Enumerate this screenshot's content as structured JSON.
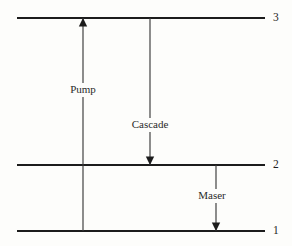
{
  "diagram": {
    "type": "energy-level-diagram",
    "background_color": "#fdfdfb",
    "line_color": "#1c1c1c",
    "canvas": {
      "width": 292,
      "height": 246
    },
    "levels": [
      {
        "id": "level-3",
        "label": "3",
        "y": 18,
        "x_start": 17,
        "x_end": 265,
        "label_x": 273
      },
      {
        "id": "level-2",
        "label": "2",
        "y": 165,
        "x_start": 17,
        "x_end": 265,
        "label_x": 273
      },
      {
        "id": "level-1",
        "label": "1",
        "y": 231,
        "x_start": 17,
        "x_end": 265,
        "label_x": 273
      }
    ],
    "transitions": [
      {
        "id": "pump",
        "label": "Pump",
        "from_level": "1",
        "to_level": "3",
        "direction": "up",
        "x": 83,
        "y_from": 231,
        "y_to": 18,
        "label_x": 83,
        "label_y": 90
      },
      {
        "id": "cascade",
        "label": "Cascade",
        "from_level": "3",
        "to_level": "2",
        "direction": "down",
        "x": 150,
        "y_from": 18,
        "y_to": 165,
        "label_x": 150,
        "label_y": 125
      },
      {
        "id": "maser",
        "label": "Maser",
        "from_level": "2",
        "to_level": "1",
        "direction": "down",
        "x": 216,
        "y_from": 165,
        "y_to": 231,
        "label_x": 212,
        "label_y": 196
      }
    ]
  },
  "chart_data": {
    "type": "diagram",
    "categories": [
      "1",
      "2",
      "3"
    ],
    "values": [
      231,
      165,
      18
    ],
    "xlabel": "",
    "ylabel": "Energy level",
    "annotations": [
      "Pump",
      "Cascade",
      "Maser"
    ]
  }
}
